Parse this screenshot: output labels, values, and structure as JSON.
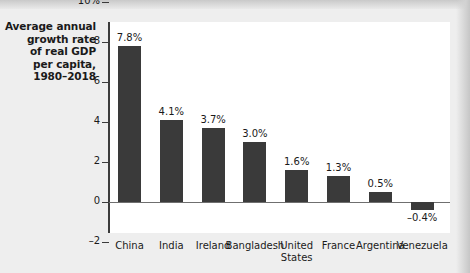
{
  "chart_data": {
    "type": "bar",
    "title": "Average annual growth rate of real GDP per capita, 1980–2018",
    "title_lines": [
      "Average annual",
      "growth rate",
      "of real GDP",
      "per capita,",
      "1980–2018"
    ],
    "xlabel": "",
    "ylabel": "",
    "ylim": [
      -3,
      10.6
    ],
    "grid": false,
    "legend": null,
    "yticks": [
      10,
      8,
      6,
      4,
      2,
      0,
      -2
    ],
    "ytick_labels": [
      "10%",
      "8",
      "6",
      "4",
      "2",
      "0",
      "–2"
    ],
    "categories": [
      "China",
      "India",
      "Ireland",
      "Bangladesh",
      "United States",
      "France",
      "Argentina",
      "Venezuela"
    ],
    "category_label_lines": [
      [
        "China"
      ],
      [
        "India"
      ],
      [
        "Ireland"
      ],
      [
        "Bangladesh"
      ],
      [
        "United",
        "States"
      ],
      [
        "France"
      ],
      [
        "Argentina"
      ],
      [
        "Venezuela"
      ]
    ],
    "values": [
      7.8,
      4.1,
      3.7,
      3.0,
      1.6,
      1.3,
      0.5,
      -0.4
    ],
    "value_labels": [
      "7.8%",
      "4.1%",
      "3.7%",
      "3.0%",
      "1.6%",
      "1.3%",
      "0.5%",
      "–0.4%"
    ],
    "colors": {
      "bar": "#3a3a3a",
      "plot_background": "#ffffff",
      "figure_background": "#eeeeee",
      "axis": "#3b3b3b",
      "baseline": "#6f6f6f",
      "text": "#1a1a1a"
    }
  }
}
